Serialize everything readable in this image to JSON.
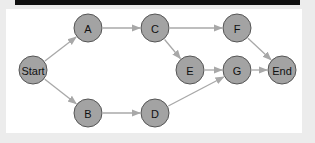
{
  "diagram": {
    "type": "directed-flow-graph",
    "colors": {
      "node_fill": "#a3a3a3",
      "node_stroke": "#555555",
      "edge": "#a8a8a8",
      "top_bar": "#111111",
      "background": "#ececec",
      "panel": "#ffffff"
    },
    "nodes": [
      {
        "id": "start",
        "label": "Start",
        "x": 33,
        "y": 70
      },
      {
        "id": "a",
        "label": "A",
        "x": 88,
        "y": 28
      },
      {
        "id": "b",
        "label": "B",
        "x": 88,
        "y": 113
      },
      {
        "id": "c",
        "label": "C",
        "x": 155,
        "y": 28
      },
      {
        "id": "d",
        "label": "D",
        "x": 155,
        "y": 113
      },
      {
        "id": "e",
        "label": "E",
        "x": 190,
        "y": 70
      },
      {
        "id": "f",
        "label": "F",
        "x": 237,
        "y": 28
      },
      {
        "id": "g",
        "label": "G",
        "x": 237,
        "y": 70
      },
      {
        "id": "end",
        "label": "End",
        "x": 282,
        "y": 70
      }
    ],
    "edges": [
      {
        "from": "start",
        "to": "a"
      },
      {
        "from": "start",
        "to": "b"
      },
      {
        "from": "a",
        "to": "c"
      },
      {
        "from": "c",
        "to": "f"
      },
      {
        "from": "c",
        "to": "e"
      },
      {
        "from": "e",
        "to": "g"
      },
      {
        "from": "f",
        "to": "end"
      },
      {
        "from": "g",
        "to": "end"
      },
      {
        "from": "b",
        "to": "d"
      },
      {
        "from": "d",
        "to": "g"
      }
    ],
    "node_radius": 14
  }
}
